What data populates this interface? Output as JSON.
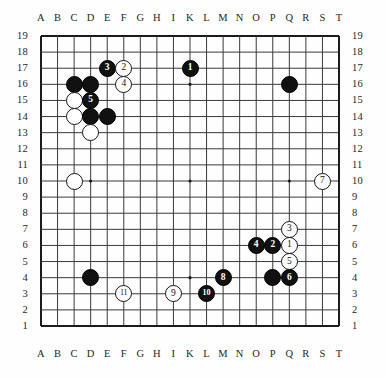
{
  "diagram": {
    "type": "go-board",
    "size": 19,
    "column_labels": [
      "A",
      "B",
      "C",
      "D",
      "E",
      "F",
      "G",
      "H",
      "I",
      "K",
      "L",
      "M",
      "N",
      "O",
      "P",
      "Q",
      "R",
      "S",
      "T"
    ],
    "row_labels": [
      "19",
      "18",
      "17",
      "16",
      "15",
      "14",
      "13",
      "12",
      "11",
      "10",
      "9",
      "8",
      "7",
      "6",
      "5",
      "4",
      "3",
      "2",
      "1"
    ],
    "star_points": [
      {
        "col": "D",
        "row": 16
      },
      {
        "col": "K",
        "row": 16
      },
      {
        "col": "Q",
        "row": 16
      },
      {
        "col": "D",
        "row": 10
      },
      {
        "col": "K",
        "row": 10
      },
      {
        "col": "Q",
        "row": 10
      },
      {
        "col": "D",
        "row": 4
      },
      {
        "col": "K",
        "row": 4
      },
      {
        "col": "Q",
        "row": 4
      }
    ],
    "colors": {
      "black_stone": "#111111",
      "white_stone": "#ffffff",
      "stone_outline": "#161616",
      "grid_line": "#3a3a3a",
      "board_edge": "#1b1b1b",
      "background": "#fefefe",
      "label": "#262626"
    },
    "stones": [
      {
        "col": "C",
        "row": 16,
        "color": "black",
        "label": ""
      },
      {
        "col": "D",
        "row": 16,
        "color": "black",
        "label": ""
      },
      {
        "col": "E",
        "row": 17,
        "color": "black",
        "label": "3"
      },
      {
        "col": "F",
        "row": 17,
        "color": "white",
        "label": "2"
      },
      {
        "col": "F",
        "row": 16,
        "color": "white",
        "label": "4"
      },
      {
        "col": "C",
        "row": 15,
        "color": "white",
        "label": ""
      },
      {
        "col": "D",
        "row": 15,
        "color": "black",
        "label": "5"
      },
      {
        "col": "C",
        "row": 14,
        "color": "white",
        "label": ""
      },
      {
        "col": "D",
        "row": 14,
        "color": "black",
        "label": ""
      },
      {
        "col": "E",
        "row": 14,
        "color": "black",
        "label": ""
      },
      {
        "col": "D",
        "row": 13,
        "color": "white",
        "label": ""
      },
      {
        "col": "C",
        "row": 10,
        "color": "white",
        "label": ""
      },
      {
        "col": "K",
        "row": 17,
        "color": "black",
        "label": "1"
      },
      {
        "col": "Q",
        "row": 16,
        "color": "black",
        "label": ""
      },
      {
        "col": "S",
        "row": 10,
        "color": "white",
        "label": "7"
      },
      {
        "col": "Q",
        "row": 7,
        "color": "white",
        "label": "3"
      },
      {
        "col": "O",
        "row": 6,
        "color": "black",
        "label": "4"
      },
      {
        "col": "P",
        "row": 6,
        "color": "black",
        "label": "2"
      },
      {
        "col": "Q",
        "row": 6,
        "color": "white",
        "label": "1"
      },
      {
        "col": "Q",
        "row": 5,
        "color": "white",
        "label": "5"
      },
      {
        "col": "M",
        "row": 4,
        "color": "black",
        "label": "8"
      },
      {
        "col": "P",
        "row": 4,
        "color": "black",
        "label": ""
      },
      {
        "col": "Q",
        "row": 4,
        "color": "black",
        "label": "6"
      },
      {
        "col": "D",
        "row": 4,
        "color": "black",
        "label": ""
      },
      {
        "col": "F",
        "row": 3,
        "color": "white",
        "label": "11"
      },
      {
        "col": "I",
        "row": 3,
        "color": "white",
        "label": "9"
      },
      {
        "col": "L",
        "row": 3,
        "color": "black",
        "label": "10"
      }
    ]
  }
}
